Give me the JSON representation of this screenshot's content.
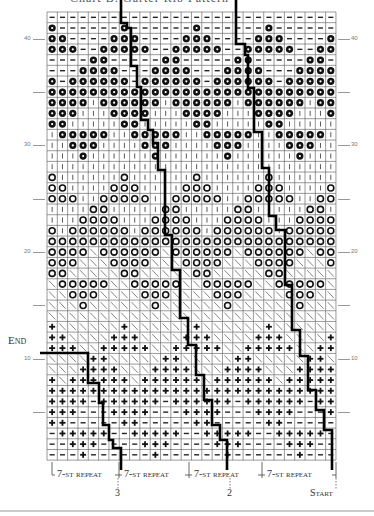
{
  "title": "Chart B: Garter Rib Pattern",
  "legend_symbols": {
    "B": "bobble-filled-flower",
    "-": "dash",
    "|": "vertical-bar",
    "O": "hollow-circle",
    "\\": "diagonal",
    "+": "plus"
  },
  "grid": {
    "cols": 28,
    "rows": 42,
    "left": 47,
    "top": 12,
    "cell_w": 10.32,
    "cell_h": 10.67,
    "rows_top_to_bottom": [
      "----------------------------",
      "B------B------B------B------",
      "BB----BBB----BBB----BBB----B",
      "BBB--BBBBB--BBBBB--BBBBB--BB",
      "----BB-----BB-----BB-----BB-",
      "---BBBB---BBBB---BBBB---BBBB",
      "B-BBBBBB-BBBBBB-BBBBBB-BBBBB",
      "BBBBBBBBBBBBBBBBBBBBBBBBBBBB",
      "BBBB|BBBBBB|BBBBBB|BBBBBB|BBB",
      "BBB|||BBBB|||BBBB|||BBBB|||B",
      "BB|||||BB|||||BB|||||BB|||||",
      "|BBBBB||BBBBB||BBBBB||BBBBB|",
      "||BBB||||BBB||||BBB||||BBB||",
      "|||B||||||B||||||B||||||B|||",
      "||||||||||||||||||||||||||||",
      "O||||||O||||||O||||||O||||||",
      "OO||||OOO||||OOO||||OOO||||O",
      "OOO||OOOOO||OOOOO||OOOOO||OO",
      "||||OO|||||OO|||||OO|||||OO|",
      "|||OOOO|||OOOO|||OOOO|||OOOO",
      "O|OOOOOO|OOOOOO|OOOOOO|OOOOO",
      "OOOOOOOOOOOOOOOOOOOOOOOOOOOO",
      "OOOO\\OOOOOO\\OOOOOO\\OOOOOO\\OO",
      "OOO\\\\\\OOOO\\\\\\OOOO\\\\\\OOOO\\\\\\O",
      "OO\\\\\\\\\\OO\\\\\\\\\\OO\\\\\\\\\\OO\\\\\\\\\\",
      "\\OOOOO\\\\OOOOO\\\\OOOOO\\\\OOOOO\\",
      "\\\\OOO\\\\\\\\OOO\\\\\\\\OOO\\\\\\\\OOO\\\\",
      "\\\\\\O\\\\\\\\\\\\O\\\\\\\\\\\\O\\\\\\\\\\\\O\\\\\\",
      "\\\\\\\\\\\\\\\\\\\\\\\\\\\\\\\\\\\\\\\\\\\\\\\\\\\\\\\\\\\\",
      "+\\\\\\\\\\\\+\\\\\\\\\\\\+\\\\\\\\\\\\+\\\\\\\\\\\\",
      "++\\\\\\\\+++\\\\\\\\+++\\\\\\\\+++\\\\\\\\+",
      "+++\\\\+++++\\\\+++++\\\\+++++\\\\++",
      "\\\\\\\\++\\\\\\\\\\++\\\\\\\\\\++\\\\\\\\\\++\\",
      "\\\\\\++++\\\\\\++++\\\\\\++++\\\\\\++++",
      "+\\++++++\\++++++\\++++++\\+++++",
      "++++++++++++++++++++++++++++",
      "++++-++++++-++++++-++++++-++",
      "+++---++++---++++---++++---+",
      "++-----++-----++-----++-----",
      "-+++++--+++++--+++++--+++++-",
      "--+++----+++----+++----+++--",
      "---+------+------+------+---"
    ]
  },
  "row_labels": [
    {
      "row": 40,
      "text": "40"
    },
    {
      "row": 35,
      "text": ""
    },
    {
      "row": 30,
      "text": "30"
    },
    {
      "row": 25,
      "text": ""
    },
    {
      "row": 20,
      "text": "20"
    },
    {
      "row": 15,
      "text": ""
    },
    {
      "row": 10,
      "text": "10"
    },
    {
      "row": 5,
      "text": ""
    }
  ],
  "lines": [
    {
      "name": "line-to-2",
      "points": "121,0 121,23 127,23 127,28 131,28 131,66 137,66 137,87 141,87 141,120 148,120 148,130 153,130 153,143 158,143 158,170 165,170 165,235 172,235 172,270 180,270 180,318 188,318 188,345 196,345 196,375 204,375 204,400 212,400 212,425 220,425 220,440 227,440 227,470"
    },
    {
      "name": "line-to-start",
      "points": "236,0 236,44 245,44 245,55 248,55 248,88 254,88 254,132 262,132 262,168 269,168 269,216 276,216 276,230 285,230 285,285 292,285 292,330 300,330 300,356 308,356 308,390 316,390 316,410 324,410 324,430 332,430 332,470"
    },
    {
      "name": "end-line-to-3",
      "points": "40,353 88,353 88,383 99,383 99,403 103,403 103,425 109,425 109,440 113,440 113,448 121,448 121,470"
    }
  ],
  "footer": {
    "repeat_labels": [
      "7-st repeat",
      "7-st repeat",
      "7-st repeat",
      "7-st repeat"
    ],
    "markers": [
      {
        "text": "3",
        "x": 118
      },
      {
        "text": "2",
        "x": 230
      },
      {
        "text": "Start",
        "x": 336
      }
    ],
    "end_label": "End"
  }
}
